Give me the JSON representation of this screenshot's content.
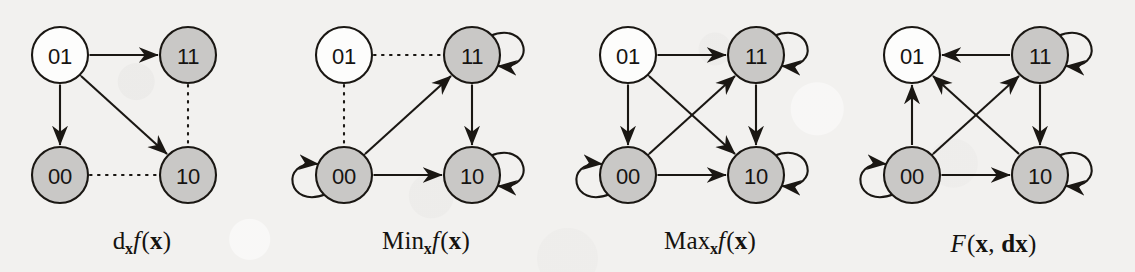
{
  "figure": {
    "width": 1135,
    "height": 272,
    "background_color": "#f2f1ef",
    "stroke_color": "#1a1713",
    "node_fill_white": "#fdfdfc",
    "node_fill_gray": "#c9c8c6",
    "node_radius": 28,
    "panels": [
      {
        "id": "dxf",
        "x": 0,
        "width": 284,
        "caption": {
          "parts": [
            {
              "text": "d",
              "style": "roman"
            },
            {
              "text": "x",
              "style": "subscript-bold"
            },
            {
              "text": "f",
              "style": "italic"
            },
            {
              "text": "(",
              "style": "roman"
            },
            {
              "text": "x",
              "style": "bold"
            },
            {
              "text": ")",
              "style": "roman"
            }
          ],
          "plain": "dxf(x)"
        },
        "nodes": [
          {
            "label": "01",
            "position": "top-left",
            "cx": 60,
            "cy": 55,
            "fill": "white"
          },
          {
            "label": "11",
            "position": "top-right",
            "cx": 188,
            "cy": 55,
            "fill": "gray"
          },
          {
            "label": "00",
            "position": "bottom-left",
            "cx": 60,
            "cy": 175,
            "fill": "gray"
          },
          {
            "label": "10",
            "position": "bottom-right",
            "cx": 188,
            "cy": 175,
            "fill": "gray"
          }
        ],
        "edges": [
          {
            "from": "01",
            "to": "11",
            "line": "solid",
            "arrows": "both"
          },
          {
            "from": "01",
            "to": "00",
            "line": "solid",
            "arrows": "both"
          },
          {
            "from": "01",
            "to": "10",
            "line": "solid",
            "arrows": "both",
            "kind": "diagonal"
          },
          {
            "from": "11",
            "to": "10",
            "line": "dotted",
            "arrows": "none"
          },
          {
            "from": "00",
            "to": "10",
            "line": "dotted",
            "arrows": "none"
          }
        ],
        "self_loops": []
      },
      {
        "id": "minxf",
        "x": 284,
        "width": 284,
        "caption": {
          "parts": [
            {
              "text": "Min",
              "style": "roman"
            },
            {
              "text": "x",
              "style": "subscript-bold"
            },
            {
              "text": "f",
              "style": "italic"
            },
            {
              "text": "(",
              "style": "roman"
            },
            {
              "text": "x",
              "style": "bold"
            },
            {
              "text": ")",
              "style": "roman"
            }
          ],
          "plain": "Minxf(x)"
        },
        "nodes": [
          {
            "label": "01",
            "position": "top-left",
            "cx": 60,
            "cy": 55,
            "fill": "white"
          },
          {
            "label": "11",
            "position": "top-right",
            "cx": 188,
            "cy": 55,
            "fill": "gray"
          },
          {
            "label": "00",
            "position": "bottom-left",
            "cx": 60,
            "cy": 175,
            "fill": "gray"
          },
          {
            "label": "10",
            "position": "bottom-right",
            "cx": 188,
            "cy": 175,
            "fill": "gray"
          }
        ],
        "edges": [
          {
            "from": "01",
            "to": "11",
            "line": "dotted",
            "arrows": "none"
          },
          {
            "from": "01",
            "to": "00",
            "line": "dotted",
            "arrows": "none"
          },
          {
            "from": "00",
            "to": "11",
            "line": "solid",
            "arrows": "both",
            "kind": "diagonal"
          },
          {
            "from": "11",
            "to": "10",
            "line": "solid",
            "arrows": "both"
          },
          {
            "from": "00",
            "to": "10",
            "line": "solid",
            "arrows": "both"
          }
        ],
        "self_loops": [
          {
            "node": "11",
            "side": "right"
          },
          {
            "node": "00",
            "side": "left"
          },
          {
            "node": "10",
            "side": "right"
          }
        ]
      },
      {
        "id": "maxxf",
        "x": 568,
        "width": 284,
        "caption": {
          "parts": [
            {
              "text": "Max",
              "style": "roman"
            },
            {
              "text": "x",
              "style": "subscript-bold"
            },
            {
              "text": "f",
              "style": "italic"
            },
            {
              "text": "(",
              "style": "roman"
            },
            {
              "text": "x",
              "style": "bold"
            },
            {
              "text": ")",
              "style": "roman"
            }
          ],
          "plain": "Maxxf(x)"
        },
        "nodes": [
          {
            "label": "01",
            "position": "top-left",
            "cx": 60,
            "cy": 55,
            "fill": "white"
          },
          {
            "label": "11",
            "position": "top-right",
            "cx": 188,
            "cy": 55,
            "fill": "gray"
          },
          {
            "label": "00",
            "position": "bottom-left",
            "cx": 60,
            "cy": 175,
            "fill": "gray"
          },
          {
            "label": "10",
            "position": "bottom-right",
            "cx": 188,
            "cy": 175,
            "fill": "gray"
          }
        ],
        "edges": [
          {
            "from": "01",
            "to": "11",
            "line": "solid",
            "arrows": "both"
          },
          {
            "from": "01",
            "to": "00",
            "line": "solid",
            "arrows": "both"
          },
          {
            "from": "11",
            "to": "10",
            "line": "solid",
            "arrows": "both"
          },
          {
            "from": "00",
            "to": "10",
            "line": "solid",
            "arrows": "both"
          },
          {
            "from": "01",
            "to": "10",
            "line": "solid",
            "arrows": "both",
            "kind": "diagonal"
          },
          {
            "from": "00",
            "to": "11",
            "line": "solid",
            "arrows": "both",
            "kind": "diagonal"
          }
        ],
        "self_loops": [
          {
            "node": "11",
            "side": "right"
          },
          {
            "node": "00",
            "side": "left"
          },
          {
            "node": "10",
            "side": "right"
          }
        ]
      },
      {
        "id": "Fxdx",
        "x": 852,
        "width": 283,
        "caption": {
          "parts": [
            {
              "text": "F",
              "style": "italic"
            },
            {
              "text": "(",
              "style": "roman"
            },
            {
              "text": "x",
              "style": "bold"
            },
            {
              "text": ", ",
              "style": "roman"
            },
            {
              "text": "dx",
              "style": "bold"
            },
            {
              "text": ")",
              "style": "roman"
            }
          ],
          "plain": "F(x, dx)"
        },
        "nodes": [
          {
            "label": "01",
            "position": "top-left",
            "cx": 60,
            "cy": 55,
            "fill": "white"
          },
          {
            "label": "11",
            "position": "top-right",
            "cx": 188,
            "cy": 55,
            "fill": "gray"
          },
          {
            "label": "00",
            "position": "bottom-left",
            "cx": 60,
            "cy": 175,
            "fill": "gray"
          },
          {
            "label": "10",
            "position": "bottom-right",
            "cx": 188,
            "cy": 175,
            "fill": "gray"
          }
        ],
        "edges": [
          {
            "from": "11",
            "to": "01",
            "line": "solid",
            "arrows": "forward"
          },
          {
            "from": "00",
            "to": "01",
            "line": "solid",
            "arrows": "forward"
          },
          {
            "from": "11",
            "to": "10",
            "line": "solid",
            "arrows": "both"
          },
          {
            "from": "00",
            "to": "10",
            "line": "solid",
            "arrows": "both"
          },
          {
            "from": "10",
            "to": "01",
            "line": "solid",
            "arrows": "forward",
            "kind": "diagonal"
          },
          {
            "from": "00",
            "to": "11",
            "line": "solid",
            "arrows": "both",
            "kind": "diagonal"
          }
        ],
        "self_loops": [
          {
            "node": "11",
            "side": "right"
          },
          {
            "node": "00",
            "side": "left"
          },
          {
            "node": "10",
            "side": "right"
          }
        ]
      }
    ]
  }
}
